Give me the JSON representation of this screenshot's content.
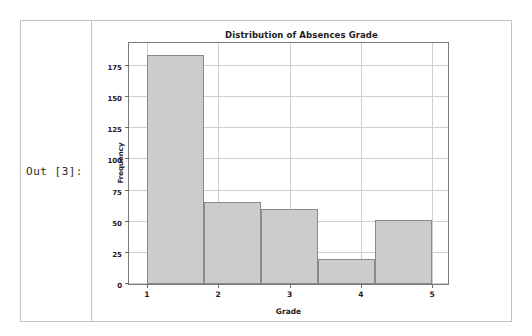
{
  "cell": {
    "prompt": "Out [3]:"
  },
  "chart_data": {
    "type": "bar",
    "title": "Distribution of Absences Grade",
    "xlabel": "Grade",
    "ylabel": "Frequency",
    "grid": true,
    "legend": "none",
    "xlim": [
      0.75,
      5.25
    ],
    "ylim": [
      0,
      195
    ],
    "xticks": [
      "1",
      "2",
      "3",
      "4",
      "5"
    ],
    "xtick_values": [
      1,
      2,
      3,
      4,
      5
    ],
    "yticks": [
      "0",
      "25",
      "50",
      "75",
      "100",
      "125",
      "150",
      "175"
    ],
    "ytick_values": [
      0,
      25,
      50,
      75,
      100,
      125,
      150,
      175
    ],
    "bin_edges": [
      1,
      1.8,
      2.6,
      3.4,
      4.2,
      5
    ],
    "categories": [
      "1.0-1.8",
      "1.8-2.6",
      "2.6-3.4",
      "3.4-4.2",
      "4.2-5.0"
    ],
    "values": [
      184,
      66,
      60,
      20,
      51
    ],
    "bar_fill_color": "#cccccc",
    "bar_edge_color": "#8a8a8a",
    "grid_color": "#cfcfcf",
    "axes_color": "#7a7a7a"
  }
}
